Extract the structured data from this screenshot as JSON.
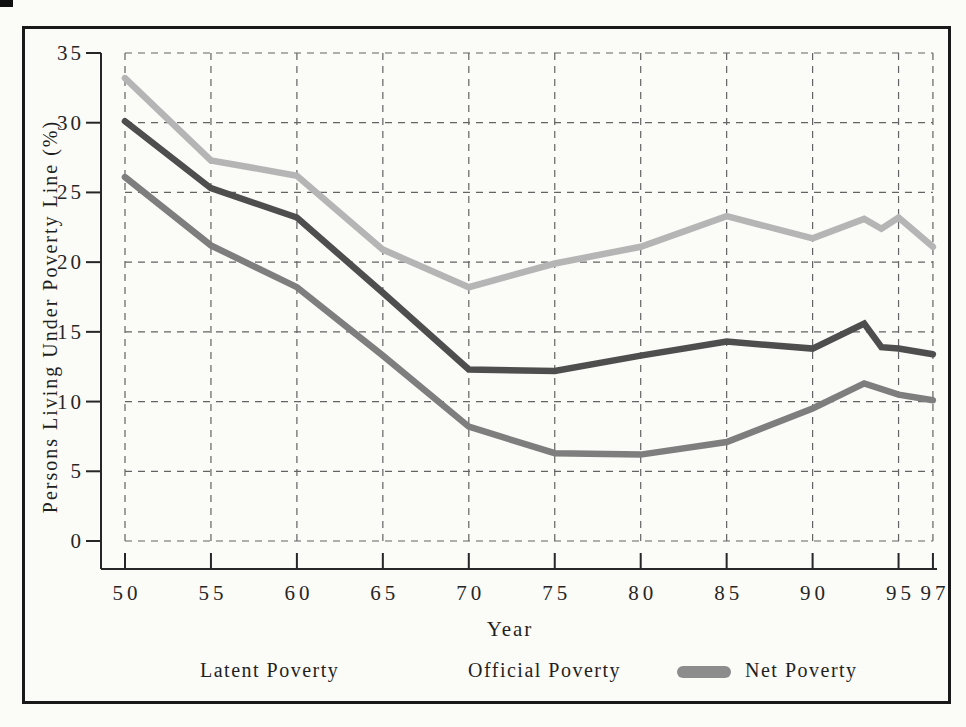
{
  "page": {
    "background": "#fbfbf8",
    "frame_color": "#191919"
  },
  "chart_data": {
    "type": "line",
    "title": "",
    "xlabel": "Year",
    "ylabel": "Persons Living Under Poverty Line (%)",
    "xlim": [
      50,
      97
    ],
    "ylim": [
      0,
      35
    ],
    "grid": "dashed",
    "legend_position": "bottom",
    "x_ticks": [
      "50",
      "55",
      "60",
      "65",
      "70",
      "75",
      "80",
      "85",
      "90",
      "95",
      "97"
    ],
    "x_tick_years": [
      50,
      55,
      60,
      65,
      70,
      75,
      80,
      85,
      90,
      95,
      97
    ],
    "y_ticks": [
      0,
      5,
      10,
      15,
      20,
      25,
      30,
      35
    ],
    "series": [
      {
        "name": "Latent Poverty",
        "color": "#b5b5b5",
        "x": [
          50,
          55,
          60,
          65,
          70,
          75,
          80,
          85,
          90,
          93,
          94,
          95,
          97
        ],
        "values": [
          33.2,
          27.3,
          26.2,
          20.9,
          18.2,
          19.9,
          21.1,
          23.3,
          21.7,
          23.1,
          22.4,
          23.2,
          21.1
        ]
      },
      {
        "name": "Official Poverty",
        "color": "#4e4e4e",
        "x": [
          50,
          55,
          60,
          65,
          70,
          75,
          80,
          85,
          90,
          93,
          94,
          95,
          97
        ],
        "values": [
          30.1,
          25.3,
          23.2,
          17.8,
          12.3,
          12.2,
          13.3,
          14.3,
          13.8,
          15.6,
          13.9,
          13.8,
          13.4
        ]
      },
      {
        "name": "Net Poverty",
        "color": "#7e7e7e",
        "x": [
          50,
          55,
          60,
          65,
          70,
          75,
          80,
          85,
          90,
          93,
          95,
          97
        ],
        "values": [
          26.1,
          21.2,
          18.2,
          13.3,
          8.2,
          6.3,
          6.2,
          7.1,
          9.5,
          11.3,
          10.5,
          10.1
        ]
      }
    ]
  },
  "legend": {
    "swatch_color": "#8c8c8c"
  }
}
